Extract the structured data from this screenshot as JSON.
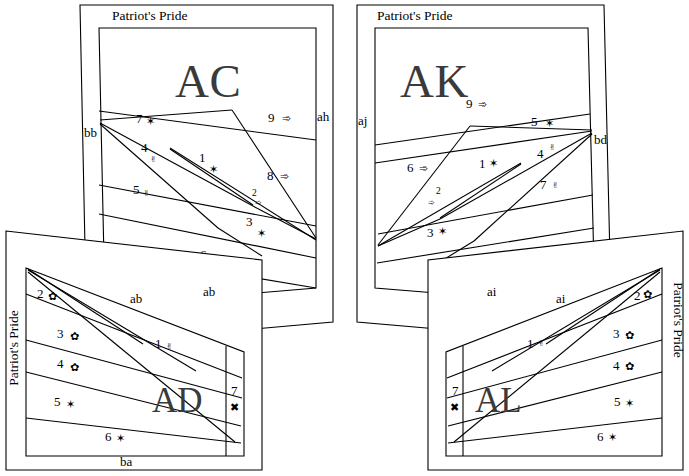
{
  "diagram": {
    "type": "four-panel-schematic",
    "background_color": "#ffffff",
    "line_color": "#000000",
    "code_color": "#3a3a3a",
    "glyphs": {
      "star": "✶",
      "hand": "✌",
      "arrow": "➾",
      "florette": "✿",
      "cross": "✖"
    }
  },
  "panels": {
    "ac": {
      "title": "Patriot's Pride",
      "code": "AC",
      "edge_left": "bb",
      "edge_right": "ah",
      "zones": [
        {
          "num": "9",
          "glyph": "➾"
        },
        {
          "num": "7",
          "glyph": "✶"
        },
        {
          "num": "4",
          "glyph": "✌"
        },
        {
          "num": "1",
          "glyph": "✶"
        },
        {
          "num": "8",
          "glyph": "➾"
        },
        {
          "num": "5",
          "glyph": "✌"
        },
        {
          "num": "2",
          "glyph": "➾"
        },
        {
          "num": "3",
          "glyph": "✶"
        },
        {
          "num": "6",
          "glyph": "✌"
        }
      ]
    },
    "ak": {
      "title": "Patriot's Pride",
      "code": "AK",
      "edge_left": "aj",
      "edge_right": "bd",
      "zones": [
        {
          "num": "9",
          "glyph": "➾"
        },
        {
          "num": "5",
          "glyph": "✶"
        },
        {
          "num": "6",
          "glyph": "➾"
        },
        {
          "num": "1",
          "glyph": "✶"
        },
        {
          "num": "4",
          "glyph": "✌"
        },
        {
          "num": "7",
          "glyph": "✌"
        },
        {
          "num": "2",
          "glyph": "➾"
        },
        {
          "num": "3",
          "glyph": "✶"
        },
        {
          "num": "8",
          "glyph": "✌"
        }
      ]
    },
    "ad": {
      "title": "Patriot's Pride",
      "code": "AD",
      "edge_top_left": "ab",
      "edge_top_right": "ab",
      "edge_bottom": "ba",
      "zones": [
        {
          "num": "2",
          "glyph": "✿"
        },
        {
          "num": "3",
          "glyph": "✿"
        },
        {
          "num": "1",
          "glyph": "✌"
        },
        {
          "num": "4",
          "glyph": "✿"
        },
        {
          "num": "5",
          "glyph": "✶"
        },
        {
          "num": "7",
          "glyph": "✖"
        },
        {
          "num": "6",
          "glyph": "✶"
        }
      ]
    },
    "al": {
      "title": "Patriot's Pride",
      "code": "AL",
      "edge_top_left": "ai",
      "edge_top_right": "ai",
      "zones": [
        {
          "num": "2",
          "glyph": "✿"
        },
        {
          "num": "1",
          "glyph": "✌"
        },
        {
          "num": "3",
          "glyph": "✿"
        },
        {
          "num": "4",
          "glyph": "✿"
        },
        {
          "num": "7",
          "glyph": "✖"
        },
        {
          "num": "5",
          "glyph": "✶"
        },
        {
          "num": "6",
          "glyph": "✶"
        }
      ]
    }
  }
}
